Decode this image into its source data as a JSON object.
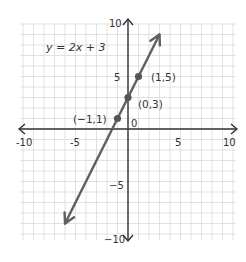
{
  "chart_data": {
    "type": "line",
    "title": "y = 2x + 3",
    "equation": "y = 2x + 3",
    "xlabel": "",
    "ylabel": "",
    "xlim": [
      -10,
      10
    ],
    "ylim": [
      -10,
      10
    ],
    "grid": true,
    "grid_step": 1,
    "x_ticks": [
      -10,
      -5,
      0,
      5,
      10
    ],
    "y_ticks": [
      -10,
      -5,
      5,
      10
    ],
    "x_tick_labels": [
      "-10",
      "-5",
      "5",
      "10"
    ],
    "y_tick_labels": [
      "10",
      "5",
      "−5",
      "−10"
    ],
    "origin_label": "0",
    "series": [
      {
        "name": "y = 2x + 3",
        "slope": 2,
        "intercept": 3,
        "line_from": [
          -6,
          -9
        ],
        "line_to": [
          3,
          9
        ],
        "arrows": "both",
        "points": [
          {
            "x": -1,
            "y": 1,
            "label": "(−1,1)"
          },
          {
            "x": 0,
            "y": 3,
            "label": "(0,3)"
          },
          {
            "x": 1,
            "y": 5,
            "label": "(1,5)"
          }
        ]
      }
    ]
  },
  "colors": {
    "grid": "#d9d9d9",
    "axis": "#333333",
    "line": "#5f5f5f",
    "point": "#555555"
  }
}
